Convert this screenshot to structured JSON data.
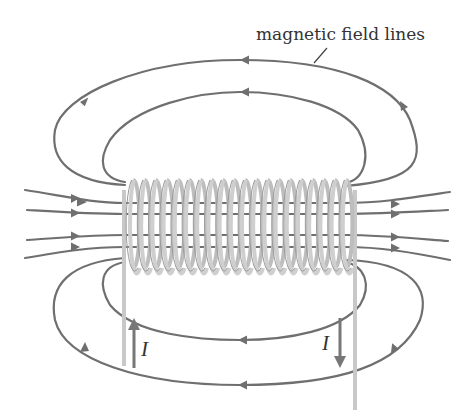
{
  "diagram": {
    "type": "solenoid-magnetic-field",
    "labels": {
      "field_lines": "magnetic field lines",
      "current_left": "I",
      "current_right": "I"
    },
    "coil": {
      "turns": 20,
      "color": "#c8c8c8"
    },
    "field_line_color": "#6f6f6f",
    "current_arrows": [
      {
        "position": "left-lead",
        "direction": "up"
      },
      {
        "position": "right-lead",
        "direction": "down"
      }
    ],
    "field_line_direction": "left-to-right inside solenoid, right-to-left returning outside"
  }
}
